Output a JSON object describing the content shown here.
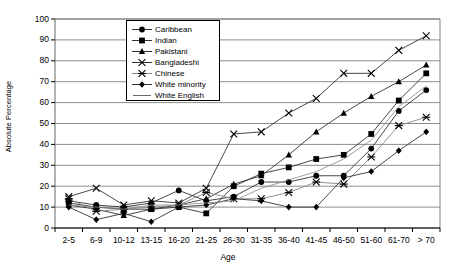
{
  "chart_data": {
    "type": "line",
    "title": "",
    "xlabel": "Age",
    "ylabel": "Absolute Percentage",
    "ylim": [
      0,
      100
    ],
    "ytick_step": 10,
    "grid": "horizontal",
    "legend_position": "top-center-inside",
    "categories": [
      "2-5",
      "6-9",
      "10-12",
      "13-15",
      "16-20",
      "21-25",
      "26-30",
      "31-35",
      "36-40",
      "41-45",
      "46-50",
      "51-60",
      "61-70",
      "> 70"
    ],
    "yticks": [
      "0",
      "10",
      "20",
      "30",
      "40",
      "50",
      "60",
      "70",
      "80",
      "90",
      "100"
    ],
    "series": [
      {
        "name": "Caribbean",
        "marker": "circle",
        "color": "#000000",
        "values": [
          13,
          11,
          10,
          12,
          18,
          13,
          15,
          22,
          22,
          25,
          25,
          38,
          56,
          66
        ]
      },
      {
        "name": "Indian",
        "marker": "square",
        "color": "#000000",
        "values": [
          12,
          10,
          9,
          9,
          10,
          7,
          20,
          26,
          29,
          33,
          35,
          45,
          61,
          74
        ]
      },
      {
        "name": "Pakistani",
        "marker": "triangle",
        "color": "#000000",
        "values": [
          11,
          9,
          6,
          9,
          11,
          14,
          21,
          25,
          35,
          46,
          55,
          63,
          70,
          78
        ]
      },
      {
        "name": "Bangladeshi",
        "marker": "cross-x",
        "color": "#000000",
        "values": [
          15,
          19,
          11,
          13,
          12,
          19,
          45,
          46,
          55,
          62,
          74,
          74,
          85,
          92
        ]
      },
      {
        "name": "Chinese",
        "marker": "star-x",
        "color": "#000000",
        "values": [
          14,
          8,
          9,
          10,
          11,
          17,
          14,
          14,
          17,
          22,
          21,
          34,
          49,
          53
        ]
      },
      {
        "name": "White minority",
        "marker": "diamond",
        "color": "#000000",
        "values": [
          10,
          4,
          7,
          3,
          10,
          11,
          14,
          13,
          10,
          10,
          24,
          27,
          37,
          46
        ]
      },
      {
        "name": "White English",
        "marker": "none",
        "color": "#000000",
        "values": [
          11,
          10,
          9,
          11,
          11,
          12,
          13,
          19,
          23,
          27,
          33,
          42,
          58,
          68
        ]
      }
    ]
  }
}
